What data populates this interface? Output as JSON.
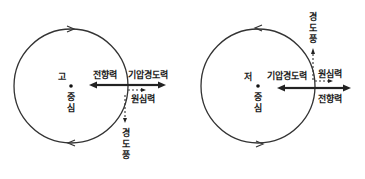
{
  "diagrams": [
    {
      "id": "high-pressure",
      "center_label": "고",
      "center_word_1": "중",
      "center_word_2": "심",
      "rotation": "clockwise",
      "forces": {
        "coriolis": "전향력",
        "pressure_gradient": "기압경도력",
        "centrifugal": "원심력",
        "gradient_wind": [
          "경",
          "도",
          "풍"
        ]
      }
    },
    {
      "id": "low-pressure",
      "center_label": "저",
      "center_word_1": "중",
      "center_word_2": "심",
      "rotation": "counterclockwise",
      "forces": {
        "pressure_gradient": "기압경도력",
        "centrifugal": "원심력",
        "coriolis": "전향력",
        "gradient_wind": [
          "경",
          "도",
          "풍"
        ]
      }
    }
  ],
  "colors": {
    "line": "#222222",
    "background": "#ffffff"
  }
}
